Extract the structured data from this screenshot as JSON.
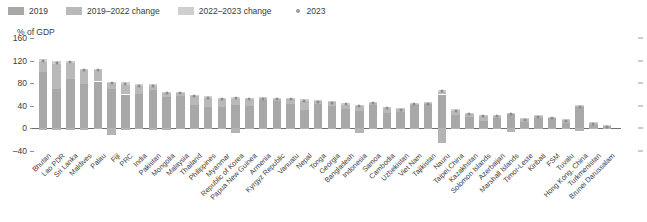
{
  "legend": {
    "items": [
      {
        "label": "2019",
        "type": "swatch",
        "color": "#a8a8a8",
        "name": "legend-2019"
      },
      {
        "label": "2019–2022 change",
        "type": "swatch",
        "color": "#b9b9b9",
        "name": "legend-2019-2022-change"
      },
      {
        "label": "2022–2023 change",
        "type": "swatch",
        "color": "#cfcfcf",
        "name": "legend-2022-2023-change"
      },
      {
        "label": "2023",
        "type": "dot",
        "color": "#9a9a9a",
        "name": "legend-2023"
      }
    ]
  },
  "axis": {
    "unit_label": "% of GDP",
    "yticks": [
      "160",
      "120",
      "80",
      "40",
      "0",
      "–40"
    ],
    "ytick_values": [
      160,
      120,
      80,
      40,
      0,
      -40
    ]
  },
  "chart_data": {
    "type": "bar",
    "title": "",
    "xlabel": "",
    "ylabel": "% of GDP",
    "ylim": [
      -40,
      160
    ],
    "grid": false,
    "legend_position": "top-left",
    "stacked": true,
    "categories": [
      "Bhutan",
      "Lao PDR",
      "Sri Lanka",
      "Maldives",
      "Palau",
      "Fiji",
      "PRC",
      "India",
      "Pakistan",
      "Mongolia",
      "Malaysia",
      "Thailand",
      "Philippines",
      "Myanmar",
      "Republic of Korea",
      "Papua New Guinea",
      "Armenia",
      "Kyrgyz Republic",
      "Vanuatu",
      "Nepal",
      "Tonga",
      "Georgia",
      "Bangladesh",
      "Indonesia",
      "Samoa",
      "Cambodia",
      "Uzbekistan",
      "Viet Nam",
      "Tajikistan",
      "Nauru",
      "Taipei,China",
      "Kazakhstan",
      "Solomon Islands",
      "Azerbaijan",
      "Marshall Islands",
      "Timor-Leste",
      "Kiribati",
      "FSM",
      "Tuvalu",
      "Hong Kong, China",
      "Turkmenistan",
      "Brunei Darussalam"
    ],
    "series": [
      {
        "name": "2019",
        "values": [
          100,
          69,
          87,
          78,
          83,
          70,
          60,
          61,
          68,
          55,
          57,
          41,
          37,
          38,
          42,
          40,
          50,
          48,
          44,
          33,
          43,
          40,
          34,
          30,
          41,
          28,
          29,
          41,
          43,
          60,
          23,
          20,
          13,
          19,
          25,
          11,
          19,
          18,
          9,
          38,
          6,
          3
        ]
      },
      {
        "name": "2019–2022 change",
        "values": [
          18,
          45,
          28,
          25,
          21,
          11,
          16,
          14,
          7,
          8,
          6,
          17,
          17,
          14,
          10,
          12,
          3,
          4,
          9,
          16,
          5,
          6,
          8,
          9,
          5,
          8,
          5,
          2,
          2,
          5,
          8,
          5,
          9,
          3,
          2,
          6,
          3,
          2,
          5,
          2,
          4,
          2
        ]
      },
      {
        "name": "2022–2023 change",
        "values": [
          4,
          5,
          5,
          3,
          2,
          2,
          6,
          3,
          3,
          2,
          2,
          2,
          3,
          2,
          4,
          2,
          2,
          2,
          1,
          3,
          2,
          2,
          3,
          3,
          1,
          2,
          2,
          2,
          1,
          3,
          3,
          3,
          2,
          2,
          1,
          1,
          1,
          1,
          2,
          1,
          1,
          1
        ]
      }
    ],
    "negative_values": [
      -3,
      -2,
      -2,
      -2,
      -1,
      -12,
      -2,
      -1,
      -2,
      -2,
      -1,
      -1,
      -1,
      -1,
      -8,
      -1,
      -1,
      -1,
      -1,
      -1,
      -1,
      -1,
      -1,
      -8,
      -1,
      -1,
      -1,
      -1,
      -1,
      -25,
      -1,
      -1,
      -1,
      -1,
      -7,
      -1,
      -1,
      -1,
      -1,
      -5,
      -1,
      -1
    ],
    "markers_2023": [
      122,
      119,
      120,
      106,
      106,
      83,
      82,
      78,
      78,
      65,
      65,
      60,
      57,
      54,
      56,
      54,
      55,
      54,
      54,
      52,
      50,
      48,
      45,
      42,
      47,
      38,
      36,
      45,
      46,
      68,
      34,
      28,
      24,
      24,
      28,
      18,
      23,
      21,
      16,
      41,
      11,
      6
    ]
  }
}
